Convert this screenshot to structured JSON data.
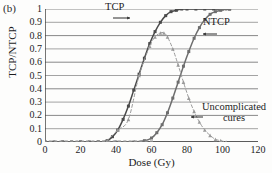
{
  "panel": {
    "label": "(b)"
  },
  "chart_data": {
    "type": "line",
    "title": "",
    "xlabel": "Dose (Gy)",
    "ylabel": "TCP/NTCP",
    "xlim": [
      0,
      120
    ],
    "ylim": [
      0,
      1
    ],
    "grid": true,
    "legend_position": "inline-annotations",
    "xticks": [
      0,
      20,
      40,
      60,
      80,
      100,
      120
    ],
    "yticks": [
      0,
      0.1,
      0.2,
      0.3,
      0.4,
      0.5,
      0.6,
      0.7,
      0.8,
      0.9,
      1
    ],
    "xtick_labels": [
      "0",
      "20",
      "40",
      "60",
      "80",
      "100",
      "120"
    ],
    "ytick_labels": [
      "0",
      "0.1",
      "0.2",
      "0.3",
      "0.4",
      "0.5",
      "0.6",
      "0.7",
      "0.8",
      "0.9",
      "1"
    ],
    "annotations": [
      {
        "text": "TCP",
        "arrow": "right"
      },
      {
        "text": "NTCP",
        "arrow": "left"
      },
      {
        "text": "Uncomplicated",
        "text2": "cures",
        "arrow": "left"
      }
    ],
    "series": [
      {
        "name": "TCP",
        "style": "solid",
        "color": "#4a4a4a",
        "marker": "square",
        "x": [
          0,
          5,
          10,
          15,
          20,
          25,
          30,
          35,
          38,
          41,
          44,
          47,
          50,
          53,
          56,
          59,
          62,
          65,
          68,
          71,
          74,
          77,
          80,
          85,
          90,
          95,
          100,
          104
        ],
        "y": [
          0,
          0,
          0,
          0,
          0,
          0,
          0,
          0.01,
          0.04,
          0.09,
          0.17,
          0.27,
          0.39,
          0.51,
          0.63,
          0.74,
          0.83,
          0.9,
          0.95,
          0.98,
          0.99,
          1,
          1,
          1,
          1,
          1,
          1,
          1
        ]
      },
      {
        "name": "NTCP",
        "style": "solid",
        "color": "#6e6e6e",
        "marker": "square",
        "x": [
          0,
          10,
          20,
          30,
          40,
          50,
          56,
          60,
          63,
          66,
          69,
          72,
          75,
          78,
          81,
          84,
          87,
          90,
          93,
          96,
          99,
          102,
          104
        ],
        "y": [
          0,
          0,
          0,
          0,
          0,
          0,
          0.01,
          0.03,
          0.07,
          0.13,
          0.22,
          0.33,
          0.45,
          0.57,
          0.68,
          0.78,
          0.86,
          0.92,
          0.96,
          0.98,
          0.99,
          1,
          1
        ]
      },
      {
        "name": "Uncomplicated cures",
        "style": "dashed",
        "color": "#9a9a9a",
        "marker": "triangle",
        "x": [
          35,
          41,
          47,
          53,
          59,
          62,
          65,
          67,
          69,
          72,
          75,
          78,
          81,
          84,
          87,
          90,
          93,
          96,
          99,
          102
        ],
        "y": [
          0.01,
          0.09,
          0.17,
          0.5,
          0.72,
          0.79,
          0.82,
          0.82,
          0.79,
          0.7,
          0.58,
          0.45,
          0.33,
          0.23,
          0.15,
          0.09,
          0.05,
          0.02,
          0.01,
          0
        ]
      },
      {
        "name": "baseline-markers",
        "style": "marker-only",
        "color": "#8d8d8d",
        "marker": "square",
        "x": [
          0,
          3,
          6,
          9,
          12,
          15,
          18,
          21,
          24,
          27,
          30,
          33,
          36,
          39,
          42,
          45,
          48,
          51,
          54,
          57,
          60
        ],
        "y": [
          0,
          0,
          0,
          0,
          0,
          0,
          0,
          0,
          0,
          0,
          0,
          0,
          0,
          0,
          0,
          0,
          0,
          0,
          0,
          0,
          0
        ]
      }
    ]
  }
}
